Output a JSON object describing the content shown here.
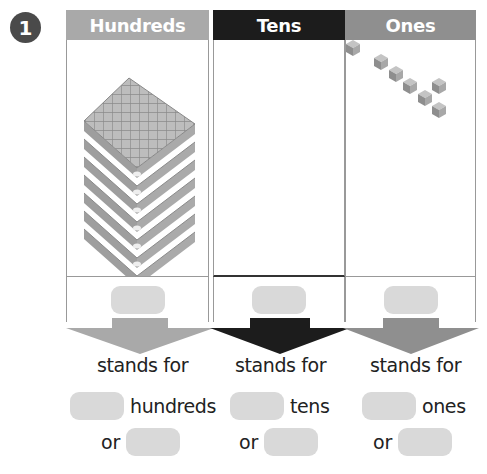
{
  "question": {
    "number": "1"
  },
  "columns": [
    {
      "key": "hundreds",
      "header": "Hundreds",
      "header_color": "#a9a9a9",
      "blocks": {
        "type": "hundreds-flat",
        "count": 7
      }
    },
    {
      "key": "tens",
      "header": "Tens",
      "header_color": "#1c1c1c",
      "blocks": {
        "type": "tens-rod",
        "count": 0
      }
    },
    {
      "key": "ones",
      "header": "Ones",
      "header_color": "#8f8f8f",
      "blocks": {
        "type": "unit-cube",
        "count": 6
      }
    }
  ],
  "answer_boxes": [
    {
      "value": ""
    },
    {
      "value": ""
    },
    {
      "value": ""
    }
  ],
  "statements": [
    {
      "stands_for": "stands for",
      "unit": "hundreds",
      "or": "or",
      "blank1": "",
      "blank2": ""
    },
    {
      "stands_for": "stands for",
      "unit": "tens",
      "or": "or",
      "blank1": "",
      "blank2": ""
    },
    {
      "stands_for": "stands for",
      "unit": "ones",
      "or": "or",
      "blank1": "",
      "blank2": ""
    }
  ]
}
